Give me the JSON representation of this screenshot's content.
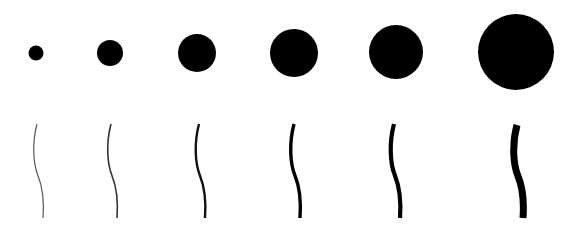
{
  "canvas": {
    "width": 565,
    "height": 232,
    "background": "#ffffff",
    "ink": "#000000"
  },
  "dots": [
    {
      "cx": 36,
      "cy": 53,
      "d": 15
    },
    {
      "cx": 110,
      "cy": 53,
      "d": 26
    },
    {
      "cx": 197,
      "cy": 53,
      "d": 38
    },
    {
      "cx": 294,
      "cy": 53,
      "d": 48
    },
    {
      "cx": 396,
      "cy": 52,
      "d": 54
    },
    {
      "cx": 516,
      "cy": 52,
      "d": 76
    }
  ],
  "strokes": [
    {
      "x": 37,
      "y_top": 124,
      "y_bottom": 218,
      "width": 1.2,
      "color": "#555555"
    },
    {
      "x": 111,
      "y_top": 124,
      "y_bottom": 218,
      "width": 1.6,
      "color": "#333333"
    },
    {
      "x": 199,
      "y_top": 124,
      "y_bottom": 218,
      "width": 2.4,
      "color": "#111111"
    },
    {
      "x": 294,
      "y_top": 124,
      "y_bottom": 218,
      "width": 3.4,
      "color": "#000000"
    },
    {
      "x": 394,
      "y_top": 124,
      "y_bottom": 218,
      "width": 4.2,
      "color": "#000000"
    },
    {
      "x": 517,
      "y_top": 125,
      "y_bottom": 218,
      "width": 7.0,
      "color": "#000000"
    }
  ]
}
